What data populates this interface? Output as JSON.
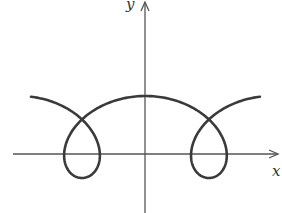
{
  "figure": {
    "width": 282,
    "height": 213,
    "background": "#ffffff",
    "stroke_color": "#3a3a3a",
    "axis_color": "#555555"
  },
  "axes": {
    "x_label": "x",
    "y_label": "y",
    "origin_px": [
      145,
      154
    ],
    "x_axis": {
      "from": 13,
      "to": 278
    },
    "y_axis": {
      "from": 213,
      "to": 2
    }
  },
  "curve": {
    "description": "Prolate cycloid (trochoid) with two loops below/around the x-axis",
    "parametric": "x = x0 + a*t - b*sin(t), y = yc + d*cos(t)",
    "params": {
      "x0": 82,
      "a": 20.2,
      "b": 45,
      "yc": 137,
      "d": 41
    },
    "t_range": [
      -2.95,
      9.233
    ],
    "features": {
      "left_loop_center_x": 82,
      "right_loop_center_x": 209,
      "peak": [
        145,
        96
      ],
      "self_intersections": [
        [
          82,
          119
        ],
        [
          209,
          119
        ]
      ],
      "loop_bottom_y": 178
    }
  }
}
